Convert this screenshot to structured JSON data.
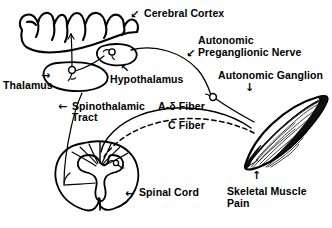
{
  "figure": {
    "background_color": "#ffffff",
    "ink_color": "#000000"
  },
  "labels": {
    "cerebral_cortex": "Cerebral Cortex",
    "autonomic_preganglionic_nerve_line1": "Autonomic",
    "autonomic_preganglionic_nerve_line2": "Preganglionic Nerve",
    "autonomic_ganglion": "Autonomic Ganglion",
    "thalamus": "Thalamus",
    "hypothalamus": "Hypothalamus",
    "spinothalamic_tract_line1": "Spinothalamic",
    "spinothalamic_tract_line2": "Tract",
    "a_delta_fiber": "A-δ Fiber",
    "c_fiber": "C Fiber",
    "spinal_cord": "Spinal Cord",
    "skeletal_muscle_pain_line1": "Skeletal Muscle",
    "skeletal_muscle_pain_line2": "Pain"
  },
  "pointers": {
    "cerebral_cortex_arrow": "↙",
    "autonomic_preganglionic_arrow": "↙",
    "autonomic_ganglion_arrow": "↓",
    "thalamus_arrow": "→",
    "hypothalamus_arrow": "↖",
    "spinothalamic_arrow": "←",
    "spinal_cord_arrow": "←",
    "skeletal_muscle_arrow": "↑"
  },
  "structures": [
    {
      "name": "cerebral-cortex",
      "description": "hand-drawn gyri outline of cerebral cortex, upper left"
    },
    {
      "name": "thalamus",
      "description": "oval nucleus containing a relay neuron cell body"
    },
    {
      "name": "hypothalamus",
      "description": "small oval nucleus containing a neuron cell body"
    },
    {
      "name": "spinal-cord",
      "description": "transverse section of spinal cord with butterfly gray matter"
    },
    {
      "name": "autonomic-ganglion",
      "description": "small circle on the preganglionic nerve path"
    },
    {
      "name": "skeletal-muscle",
      "description": "fusiform striated skeletal muscle belly"
    }
  ],
  "pathways": [
    {
      "name": "a-delta-fiber",
      "style": "solid",
      "from": "skeletal-muscle",
      "to": "spinal-cord"
    },
    {
      "name": "c-fiber",
      "style": "dashed",
      "from": "skeletal-muscle",
      "to": "spinal-cord"
    },
    {
      "name": "spinothalamic-tract",
      "style": "solid",
      "from": "spinal-cord",
      "to": "thalamus"
    },
    {
      "name": "thalamocortical-projection",
      "style": "solid",
      "from": "thalamus",
      "to": "cerebral-cortex"
    },
    {
      "name": "autonomic-preganglionic-nerve",
      "style": "solid",
      "from": "hypothalamus",
      "to": "autonomic-ganglion"
    },
    {
      "name": "postganglionic-nerve",
      "style": "solid",
      "from": "autonomic-ganglion",
      "to": "skeletal-muscle"
    }
  ]
}
